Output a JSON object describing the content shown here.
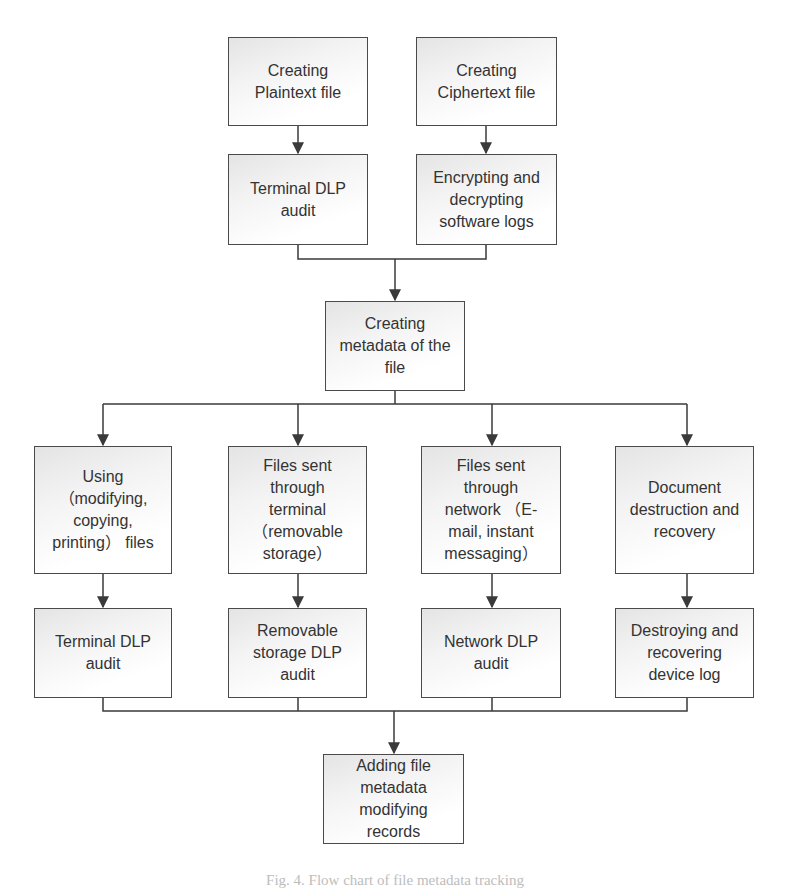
{
  "figure": {
    "caption": "Fig. 4. Flow chart of file metadata tracking",
    "colors": {
      "line": "#3a3a3a",
      "box_border": "#4a4a4a",
      "text": "#333333",
      "box_fill_start": "#e4e4e4",
      "box_fill_end": "#ffffff"
    }
  },
  "nodes": {
    "create_plaintext": "Creating\nPlaintext file",
    "create_ciphertext": "Creating\nCiphertext file",
    "terminal_dlp_audit_top": "Terminal DLP\naudit",
    "encrypt_decrypt_logs": "Encrypting and\ndecrypting\nsoftware logs",
    "create_metadata": "Creating\nmetadata of the\nfile",
    "using_files": "Using\n（modifying,\ncopying,\nprinting） files",
    "sent_terminal": "Files sent\nthrough\nterminal\n（removable\nstorage）",
    "sent_network": "Files sent\nthrough\nnetwork （E-\nmail,  instant\nmessaging）",
    "doc_destruction": "Document\ndestruction and\nrecovery",
    "terminal_dlp_audit_bottom": "Terminal DLP\naudit",
    "removable_dlp_audit": "Removable\nstorage DLP\naudit",
    "network_dlp_audit": "Network DLP\naudit",
    "destroy_recover_log": "Destroying and\nrecovering\ndevice log",
    "add_metadata_records": "Adding file\nmetadata\nmodifying\nrecords"
  }
}
